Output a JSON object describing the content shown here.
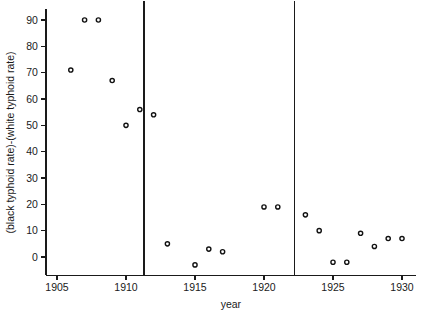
{
  "chart_data": {
    "type": "scatter",
    "title": "",
    "xlabel": "year",
    "ylabel": "(black typhoid rate)-(white typhoid rate)",
    "xlim": [
      1904.2,
      1931.0
    ],
    "ylim": [
      -7,
      94
    ],
    "xticks": [
      1905,
      1910,
      1915,
      1920,
      1925,
      1930
    ],
    "xtick_labels": [
      "1905",
      "1910",
      "1915",
      "1920",
      "1925",
      "1930"
    ],
    "yticks": [
      0,
      10,
      20,
      30,
      40,
      50,
      60,
      70,
      80,
      90
    ],
    "ytick_labels": [
      "0",
      "10",
      "20",
      "30",
      "40",
      "50",
      "60",
      "70",
      "80",
      "90"
    ],
    "grid": false,
    "legend": null,
    "marker": "open-circle",
    "marker_color": "#111111",
    "points": [
      {
        "x": 1906,
        "y": 71
      },
      {
        "x": 1907,
        "y": 90
      },
      {
        "x": 1908,
        "y": 90
      },
      {
        "x": 1909,
        "y": 67
      },
      {
        "x": 1910,
        "y": 50
      },
      {
        "x": 1911,
        "y": 56
      },
      {
        "x": 1912,
        "y": 54
      },
      {
        "x": 1913,
        "y": 5
      },
      {
        "x": 1915,
        "y": -3
      },
      {
        "x": 1916,
        "y": 3
      },
      {
        "x": 1917,
        "y": 2
      },
      {
        "x": 1920,
        "y": 19
      },
      {
        "x": 1921,
        "y": 19
      },
      {
        "x": 1923,
        "y": 16
      },
      {
        "x": 1924,
        "y": 10
      },
      {
        "x": 1925,
        "y": -2
      },
      {
        "x": 1926,
        "y": -2
      },
      {
        "x": 1927,
        "y": 9
      },
      {
        "x": 1928,
        "y": 4
      },
      {
        "x": 1929,
        "y": 7
      },
      {
        "x": 1930,
        "y": 7
      }
    ],
    "annotations": [
      {
        "type": "vertical-line",
        "x": 1911.3,
        "label": "intervention-line-1"
      },
      {
        "type": "vertical-line",
        "x": 1922.2,
        "label": "intervention-line-2"
      }
    ]
  }
}
